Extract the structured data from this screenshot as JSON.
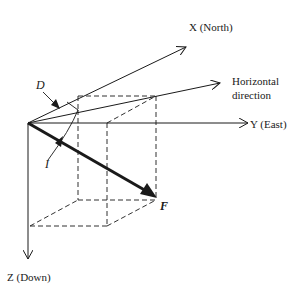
{
  "diagram": {
    "labels": {
      "x_axis": "X (North)",
      "y_axis": "Y (East)",
      "z_axis": "Z (Down)",
      "horizontal_line1": "Horizontal",
      "horizontal_line2": "direction",
      "declination": "D",
      "inclination": "I",
      "field": "F"
    },
    "colors": {
      "stroke": "#1a1a1a",
      "background": "#ffffff"
    }
  }
}
